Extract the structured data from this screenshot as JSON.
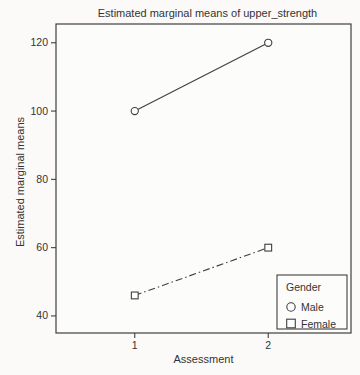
{
  "figure": {
    "background": "#fbfaf8",
    "plot_background": "#fcfcfb",
    "line_color": "#3f3f3f",
    "text_color": "#333333"
  },
  "chart_data": {
    "type": "line",
    "title": "Estimated marginal means of upper_strength",
    "xlabel": "Assessment",
    "ylabel": "Estimated marginal means",
    "x": [
      1,
      2
    ],
    "x_tick_labels": [
      "1",
      "2"
    ],
    "y_ticks": [
      40,
      60,
      80,
      100,
      120
    ],
    "xlim": [
      0.41,
      2.62
    ],
    "ylim": [
      35,
      125.5
    ],
    "grid": false,
    "series": [
      {
        "name": "Male",
        "values": [
          100,
          120
        ],
        "marker": "circle",
        "line_style": "solid"
      },
      {
        "name": "Female",
        "values": [
          46,
          60
        ],
        "marker": "square",
        "line_style": "dash-dot"
      }
    ],
    "legend": {
      "title": "Gender",
      "position": "bottom-right",
      "entries": [
        "Male",
        "Female"
      ]
    }
  }
}
